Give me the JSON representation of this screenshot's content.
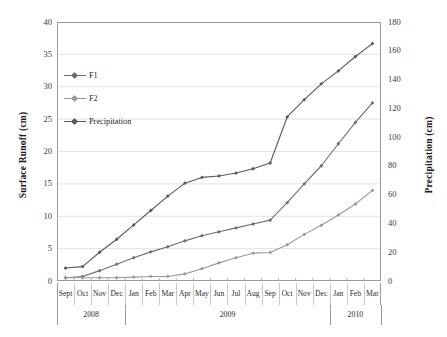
{
  "chart_data": {
    "type": "line",
    "title": "",
    "xlabel": "",
    "ylabel": "Surface Runoff (cm)",
    "y2label": "Precipitation (cm)",
    "ylim": [
      0,
      40
    ],
    "y2lim": [
      0,
      180
    ],
    "ytick_step": 5,
    "y2tick_step": 20,
    "grid": true,
    "legend_position": "upper-left-inside",
    "yticks": [
      "0",
      "5",
      "10",
      "15",
      "20",
      "25",
      "30",
      "35",
      "40"
    ],
    "y2ticks": [
      "0",
      "20",
      "40",
      "60",
      "80",
      "100",
      "120",
      "140",
      "160",
      "180"
    ],
    "categories": [
      "Sept",
      "Oct",
      "Nov",
      "Dec",
      "Jan",
      "Feb",
      "Mar",
      "Apr",
      "May",
      "Jun",
      "Jul",
      "Aug",
      "Sep",
      "Oct",
      "Nov",
      "Dec",
      "Jan",
      "Feb",
      "Mar"
    ],
    "year_groups": [
      {
        "label": "2008",
        "start": 0,
        "count": 4
      },
      {
        "label": "2009",
        "start": 4,
        "count": 12
      },
      {
        "label": "2010",
        "start": 16,
        "count": 3
      }
    ],
    "series": [
      {
        "name": "F1",
        "axis": "left",
        "color": "#6e6e6e",
        "marker": "diamond",
        "values": [
          0.5,
          0.7,
          1.6,
          2.6,
          3.6,
          4.5,
          5.3,
          6.2,
          7.0,
          7.6,
          8.2,
          8.8,
          9.4,
          12.1,
          15.0,
          17.8,
          21.2,
          24.5,
          27.5
        ]
      },
      {
        "name": "F2",
        "axis": "left",
        "color": "#9a9a9a",
        "marker": "diamond",
        "values": [
          0.5,
          0.5,
          0.5,
          0.5,
          0.6,
          0.7,
          0.7,
          1.1,
          1.9,
          2.8,
          3.6,
          4.3,
          4.4,
          5.6,
          7.2,
          8.6,
          10.2,
          11.9,
          14.0
        ]
      },
      {
        "name": "Precipitation",
        "axis": "right",
        "color": "#595959",
        "marker": "diamond",
        "values": [
          9,
          10,
          20,
          29,
          39,
          49,
          59,
          68,
          72,
          73,
          75,
          78,
          82,
          114,
          126,
          137,
          146,
          156,
          165
        ]
      }
    ]
  }
}
